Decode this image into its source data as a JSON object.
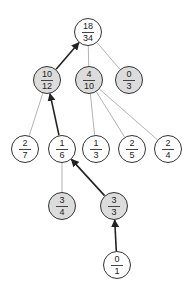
{
  "diagram": {
    "type": "tree",
    "colors": {
      "shaded_fill": "#dcdcdc",
      "plain_fill": "#ffffff",
      "stroke": "#333333",
      "thin_edge": "#aaaaaa",
      "bold_edge": "#222222"
    },
    "nodes": [
      {
        "id": "n0",
        "num": "18",
        "den": "34",
        "x": 88,
        "y": 32,
        "shaded": false
      },
      {
        "id": "n1",
        "num": "10",
        "den": "12",
        "x": 47,
        "y": 80,
        "shaded": true
      },
      {
        "id": "n2",
        "num": "4",
        "den": "10",
        "x": 89,
        "y": 80,
        "shaded": true
      },
      {
        "id": "n3",
        "num": "0",
        "den": "3",
        "x": 129,
        "y": 80,
        "shaded": true
      },
      {
        "id": "n4",
        "num": "2",
        "den": "7",
        "x": 25,
        "y": 149,
        "shaded": false
      },
      {
        "id": "n5",
        "num": "1",
        "den": "6",
        "x": 62,
        "y": 149,
        "shaded": false
      },
      {
        "id": "n6",
        "num": "1",
        "den": "3",
        "x": 96,
        "y": 149,
        "shaded": false
      },
      {
        "id": "n7",
        "num": "2",
        "den": "5",
        "x": 132,
        "y": 149,
        "shaded": false
      },
      {
        "id": "n8",
        "num": "2",
        "den": "4",
        "x": 168,
        "y": 149,
        "shaded": false
      },
      {
        "id": "n9",
        "num": "3",
        "den": "4",
        "x": 62,
        "y": 206,
        "shaded": true
      },
      {
        "id": "n10",
        "num": "3",
        "den": "3",
        "x": 114,
        "y": 206,
        "shaded": true
      },
      {
        "id": "n11",
        "num": "0",
        "den": "1",
        "x": 117,
        "y": 265,
        "shaded": false
      }
    ],
    "edges": [
      {
        "from": "n1",
        "to": "n0",
        "bold": true,
        "arrow": true
      },
      {
        "from": "n2",
        "to": "n0",
        "bold": false,
        "arrow": false
      },
      {
        "from": "n3",
        "to": "n0",
        "bold": false,
        "arrow": false
      },
      {
        "from": "n4",
        "to": "n1",
        "bold": false,
        "arrow": false
      },
      {
        "from": "n5",
        "to": "n1",
        "bold": true,
        "arrow": true
      },
      {
        "from": "n6",
        "to": "n2",
        "bold": false,
        "arrow": false
      },
      {
        "from": "n7",
        "to": "n2",
        "bold": false,
        "arrow": false
      },
      {
        "from": "n8",
        "to": "n2",
        "bold": false,
        "arrow": false
      },
      {
        "from": "n9",
        "to": "n5",
        "bold": false,
        "arrow": false
      },
      {
        "from": "n10",
        "to": "n5",
        "bold": true,
        "arrow": true
      },
      {
        "from": "n11",
        "to": "n10",
        "bold": true,
        "arrow": true
      }
    ]
  }
}
